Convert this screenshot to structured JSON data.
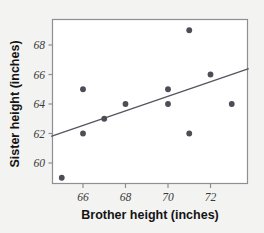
{
  "chart_data": {
    "type": "scatter",
    "title": "",
    "xlabel": "Brother height (inches)",
    "ylabel": "Sister height (inches)",
    "xlim": [
      64.5,
      73.8
    ],
    "ylim": [
      58.5,
      69.6
    ],
    "xticks": [
      "66",
      "68",
      "70",
      "72"
    ],
    "xtick_values": [
      66,
      68,
      70,
      72
    ],
    "yticks": [
      "60",
      "62",
      "64",
      "66",
      "68"
    ],
    "ytick_values": [
      60,
      62,
      64,
      66,
      68
    ],
    "grid": false,
    "legend": false,
    "point_color": "#4d4d55",
    "line_color": "#555560",
    "frame_color": "#8e8e93",
    "background": "#ffffff",
    "figure_background": "#f3f3f2",
    "points": [
      {
        "x": 65,
        "y": 59
      },
      {
        "x": 66,
        "y": 62
      },
      {
        "x": 66,
        "y": 65
      },
      {
        "x": 67,
        "y": 63
      },
      {
        "x": 68,
        "y": 64
      },
      {
        "x": 70,
        "y": 64
      },
      {
        "x": 70,
        "y": 65
      },
      {
        "x": 71,
        "y": 62
      },
      {
        "x": 71,
        "y": 69
      },
      {
        "x": 72,
        "y": 66
      },
      {
        "x": 73,
        "y": 64
      }
    ],
    "fit_line": {
      "name": "regression line",
      "x_start": 64.5,
      "y_start": 61.8,
      "x_end": 73.8,
      "y_end": 66.4
    }
  }
}
